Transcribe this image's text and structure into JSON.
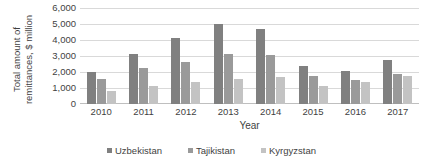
{
  "chart_data": {
    "type": "bar",
    "title": "",
    "xlabel": "Year",
    "ylabel_line1": "Total amount of",
    "ylabel_line2": "remittances, $ million",
    "categories": [
      "2010",
      "2011",
      "2012",
      "2013",
      "2014",
      "2015",
      "2016",
      "2017"
    ],
    "series": [
      {
        "name": "Uzbekistan",
        "color": "#808080",
        "values": [
          2000,
          3150,
          4100,
          5000,
          4700,
          2400,
          2080,
          2780
        ]
      },
      {
        "name": "Tajikistan",
        "color": "#9a9a9a",
        "values": [
          1550,
          2250,
          2620,
          3100,
          3080,
          1730,
          1500,
          1860
        ]
      },
      {
        "name": "Kyrgyzstan",
        "color": "#c3c3c3",
        "values": [
          800,
          1120,
          1380,
          1560,
          1680,
          1130,
          1350,
          1740
        ]
      }
    ],
    "ylim": [
      0,
      6000
    ],
    "yticks": [
      0,
      1000,
      2000,
      3000,
      4000,
      5000,
      6000
    ],
    "ytick_labels": [
      "0",
      "1,000",
      "2,000",
      "3,000",
      "4,000",
      "5,000",
      "6,000"
    ],
    "grid": true,
    "legend_position": "bottom",
    "gridline_color": "#d9d9d9",
    "axis_color": "#bfbfbf",
    "text_color": "#3f3f3f"
  }
}
